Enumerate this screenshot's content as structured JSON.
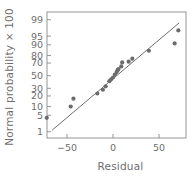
{
  "chart_data": {
    "type": "scatter",
    "title": "",
    "xlabel": "Residual",
    "ylabel": "Normal probability × 100",
    "xlim": [
      -80,
      80
    ],
    "ylim_probability": [
      1,
      99
    ],
    "grid": false,
    "legend": null,
    "x_ticks": [
      -50,
      0,
      50
    ],
    "x_tick_labels": [
      "−50",
      "0",
      "50"
    ],
    "y_ticks": [
      1,
      5,
      10,
      20,
      30,
      50,
      70,
      80,
      90,
      95,
      99
    ],
    "y_tick_labels": [
      "1",
      "5",
      "10",
      "20",
      "30",
      "50",
      "70",
      "80",
      "90",
      "95",
      "99"
    ],
    "series": [
      {
        "name": "residual-normal-plot",
        "marker": "filled-circle",
        "color": "#6b6b6d",
        "points": [
          {
            "x": -72,
            "y": 4
          },
          {
            "x": -46,
            "y": 10
          },
          {
            "x": -43,
            "y": 17
          },
          {
            "x": -17,
            "y": 23
          },
          {
            "x": -11,
            "y": 28
          },
          {
            "x": -8,
            "y": 33
          },
          {
            "x": -4,
            "y": 41
          },
          {
            "x": -2,
            "y": 44
          },
          {
            "x": 0,
            "y": 47
          },
          {
            "x": 2,
            "y": 52
          },
          {
            "x": 4,
            "y": 56
          },
          {
            "x": 5,
            "y": 59
          },
          {
            "x": 6,
            "y": 61
          },
          {
            "x": 9,
            "y": 65
          },
          {
            "x": 10,
            "y": 71
          },
          {
            "x": 17,
            "y": 72
          },
          {
            "x": 21,
            "y": 76
          },
          {
            "x": 39,
            "y": 85
          },
          {
            "x": 67,
            "y": 91
          },
          {
            "x": 71,
            "y": 97
          }
        ]
      }
    ],
    "reference_line": {
      "name": "normal-reference-line",
      "color": "#6f6f71",
      "start": {
        "x": -66,
        "y": 1.2
      },
      "end": {
        "x": 72,
        "y": 98.6
      }
    }
  }
}
